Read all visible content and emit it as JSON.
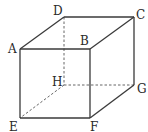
{
  "diagram": {
    "type": "cube",
    "vertices": {
      "A": {
        "label": "A",
        "x": 20,
        "y": 49
      },
      "B": {
        "label": "B",
        "x": 90,
        "y": 49
      },
      "C": {
        "label": "C",
        "x": 134,
        "y": 17
      },
      "D": {
        "label": "D",
        "x": 64,
        "y": 17
      },
      "E": {
        "label": "E",
        "x": 20,
        "y": 118
      },
      "F": {
        "label": "F",
        "x": 90,
        "y": 118
      },
      "G": {
        "label": "G",
        "x": 134,
        "y": 85
      },
      "H": {
        "label": "H",
        "x": 64,
        "y": 85
      }
    },
    "visible_edges": [
      "AB",
      "BF",
      "FE",
      "EA",
      "AD",
      "DC",
      "CB",
      "CG",
      "GF"
    ],
    "hidden_edges": [
      "DH",
      "HE",
      "HG"
    ],
    "colors": {
      "line": "#3a3a3a",
      "text": "#2a2a2a",
      "background": "#ffffff"
    }
  }
}
